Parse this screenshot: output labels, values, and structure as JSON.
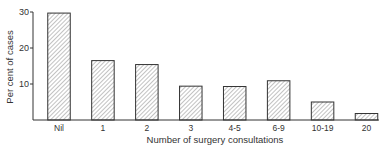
{
  "chart_data": {
    "type": "bar",
    "title": "",
    "xlabel": "Number of surgery consultations",
    "ylabel": "Per cent of cases",
    "categories": [
      "Nil",
      "1",
      "2",
      "3",
      "4-5",
      "6-9",
      "10-19",
      "20"
    ],
    "values": [
      29.7,
      16.5,
      15.4,
      9.4,
      9.3,
      10.9,
      5.0,
      1.8
    ],
    "ylim": [
      0,
      30
    ],
    "yticks": [
      10,
      20,
      30
    ],
    "grid": false,
    "legend": null,
    "bar_fill": "diagonal-hatch",
    "colors": {
      "stroke": "#333333",
      "hatch": "#666666",
      "background": "#ffffff"
    }
  }
}
